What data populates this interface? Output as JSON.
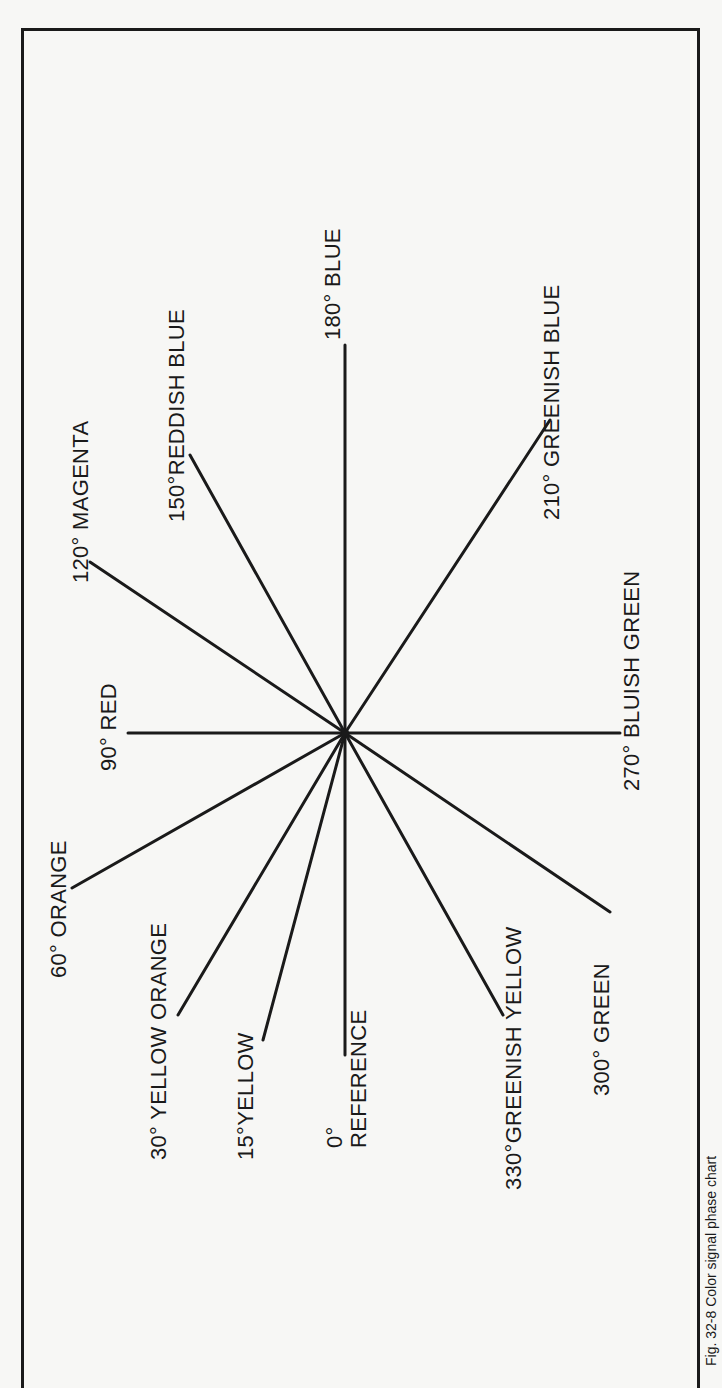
{
  "figure": {
    "caption": "Fig. 32-8  Color signal phase chart"
  },
  "chart_data": {
    "type": "phase-diagram",
    "title": "Color signal phase chart",
    "center": {
      "x": 345,
      "y": 733
    },
    "line_color": "#1a1a1a",
    "spokes": [
      {
        "angle": 0,
        "label": "0°",
        "label2": "REFERENCE",
        "end": [
          345,
          1055
        ]
      },
      {
        "angle": 15,
        "label": "15°YELLOW",
        "end": [
          263,
          1040
        ]
      },
      {
        "angle": 30,
        "label": "30° YELLOW ORANGE",
        "end": [
          178,
          1015
        ]
      },
      {
        "angle": 60,
        "label": "60° ORANGE",
        "end": [
          72,
          888
        ]
      },
      {
        "angle": 90,
        "label": "90° RED",
        "end": [
          128,
          733
        ]
      },
      {
        "angle": 120,
        "label": "120° MAGENTA",
        "end": [
          90,
          562
        ]
      },
      {
        "angle": 150,
        "label": "150°REDDISH BLUE",
        "end": [
          190,
          455
        ]
      },
      {
        "angle": 180,
        "label": "180° BLUE",
        "end": [
          345,
          345
        ]
      },
      {
        "angle": 210,
        "label": "210° GREENISH BLUE",
        "end": [
          550,
          420
        ]
      },
      {
        "angle": 270,
        "label": "270° BLUISH GREEN",
        "end": [
          620,
          733
        ]
      },
      {
        "angle": 300,
        "label": "300° GREEN",
        "end": [
          610,
          912
        ]
      },
      {
        "angle": 330,
        "label": "330°GREENISH YELLOW",
        "end": [
          503,
          1015
        ]
      }
    ]
  }
}
